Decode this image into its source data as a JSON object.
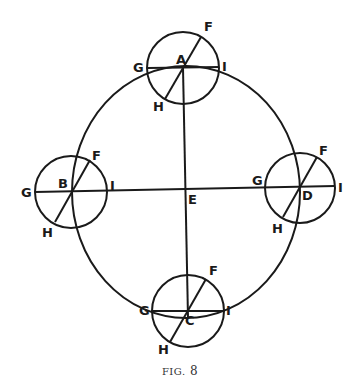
{
  "figure": {
    "caption_prefix": "FIG.",
    "caption_number": "8",
    "center_label": "E",
    "orbit": {
      "cx": 186,
      "cy": 192,
      "rx": 114,
      "ry": 126
    },
    "epicycles": [
      {
        "name": "A",
        "cx": 183,
        "cy": 68,
        "r": 36,
        "labels": {
          "center": "A",
          "F": "F",
          "G": "G",
          "H": "H",
          "I": "I"
        }
      },
      {
        "name": "B",
        "cx": 71,
        "cy": 192,
        "r": 36,
        "labels": {
          "center": "B",
          "F": "F",
          "G": "G",
          "H": "H",
          "I": "I"
        }
      },
      {
        "name": "D",
        "cx": 300,
        "cy": 188,
        "r": 35,
        "labels": {
          "center": "D",
          "F": "F",
          "G": "G",
          "H": "H",
          "I": "I"
        }
      },
      {
        "name": "C",
        "cx": 188,
        "cy": 318,
        "r": 36,
        "labels": {
          "center": "C",
          "F": "F",
          "G": "G",
          "H": "H",
          "I": "I"
        }
      }
    ]
  }
}
